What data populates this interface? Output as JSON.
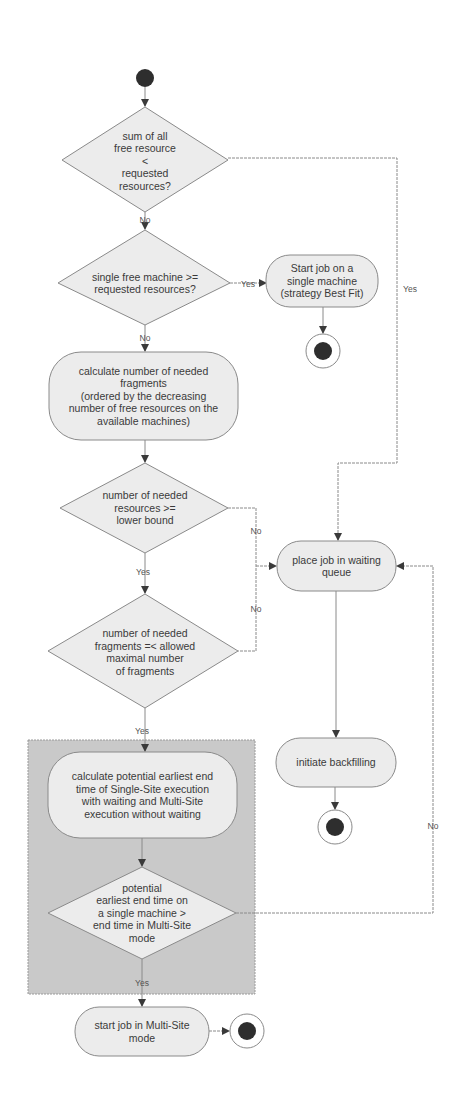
{
  "diagram": {
    "type": "uml-activity-diagram",
    "colors": {
      "node_fill": "#ececec",
      "node_stroke": "#8a8a8a",
      "group_fill": "#c9c9c9",
      "edge": "#8a8a8a",
      "terminal": "#2e2e2e",
      "text": "#3a3a3a"
    },
    "nodes": {
      "decision_sum_free": [
        "sum of all",
        "free resource",
        "<",
        "requested",
        "resources?"
      ],
      "decision_single_machine": [
        "single free machine >=",
        "requested resources?"
      ],
      "action_start_single": [
        "Start job on a",
        "single machine",
        "(strategy Best Fit)"
      ],
      "action_calc_fragments": [
        "calculate number of needed",
        "fragments",
        "(ordered by the decreasing",
        "number of free resources on the",
        "available machines)"
      ],
      "decision_lower_bound": [
        "number of needed",
        "resources >=",
        "lower bound"
      ],
      "decision_max_fragments": [
        "number of needed",
        "fragments =< allowed",
        "maximal number",
        "of fragments"
      ],
      "action_place_waiting": [
        "place job in waiting",
        "queue"
      ],
      "action_backfilling": [
        "initiate backfilling"
      ],
      "action_calc_endtime": [
        "calculate potential earliest end",
        "time of Single-Site execution",
        "with waiting and Multi-Site",
        "execution without waiting"
      ],
      "decision_endtime": [
        "potential",
        "earliest end time on",
        "a single machine  >",
        "end time in Multi-Site",
        "mode"
      ],
      "action_start_multisite": [
        "start job in Multi-Site",
        "mode"
      ]
    },
    "edge_labels": {
      "d1_no": "No",
      "d1_yes": "Yes",
      "d2_yes": "Yes",
      "d2_no": "No",
      "d3_no": "No",
      "d3_yes": "Yes",
      "d4_no": "No",
      "d4_yes": "Yes",
      "d5_no": "No",
      "d5_yes": "Yes"
    }
  }
}
